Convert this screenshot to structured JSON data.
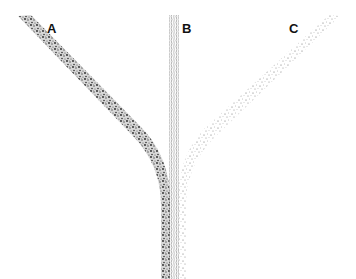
{
  "diagram": {
    "type": "converging-channels",
    "channels": [
      {
        "id": "A",
        "label": "A",
        "texture": "dense-coarse-stipple",
        "color": "#333333"
      },
      {
        "id": "B",
        "label": "B",
        "texture": "wavy-vertical-lines",
        "color": "#888888"
      },
      {
        "id": "C",
        "label": "C",
        "texture": "sparse-fine-stipple",
        "color": "#777777"
      }
    ]
  }
}
